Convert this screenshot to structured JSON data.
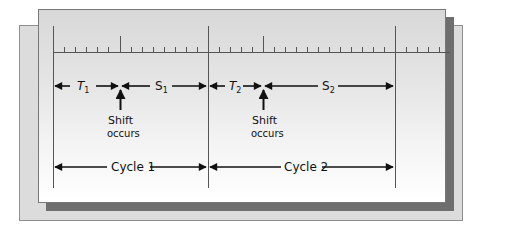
{
  "diagram": {
    "timeline": {
      "tick_spacing_px": 11,
      "major_lines": [
        "cycle-1-start",
        "cycle-2-start",
        "cycle-2-end"
      ],
      "shift_ticks": [
        "shift-1",
        "shift-2"
      ]
    },
    "segments": [
      {
        "id": "T1",
        "label": "T",
        "subscript": "1",
        "italic": true
      },
      {
        "id": "S1",
        "label": "S",
        "subscript": "1",
        "italic": false
      },
      {
        "id": "T2",
        "label": "T",
        "subscript": "2",
        "italic": true
      },
      {
        "id": "S2",
        "label": "S",
        "subscript": "2",
        "italic": false
      }
    ],
    "annotations": [
      {
        "id": "shift-1",
        "line1": "Shift",
        "line2": "occurs"
      },
      {
        "id": "shift-2",
        "line1": "Shift",
        "line2": "occurs"
      }
    ],
    "cycles": [
      {
        "id": "cycle-1",
        "label": "Cycle 1"
      },
      {
        "id": "cycle-2",
        "label": "Cycle 2"
      }
    ],
    "colors": {
      "line": "#111111",
      "axis": "#444444",
      "back_panel": "#dcdcdc",
      "shadow": "#6e6e6e"
    }
  }
}
